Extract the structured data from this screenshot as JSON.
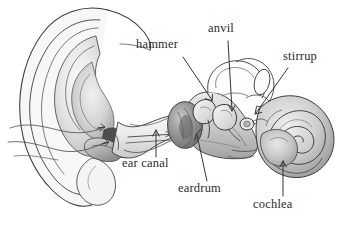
{
  "figure": {
    "style": "grayscale pencil illustration",
    "background_color": "#ffffff",
    "ink_color": "#2b2b2b",
    "width": 346,
    "height": 234
  },
  "labels": [
    {
      "id": "hammer",
      "text": "hammer",
      "x": 136,
      "y": 45,
      "leader": {
        "from_x": 183,
        "from_y": 57,
        "to_x": 212,
        "to_y": 102,
        "arrow": true
      }
    },
    {
      "id": "anvil",
      "text": "anvil",
      "x": 208,
      "y": 29,
      "leader": {
        "from_x": 228,
        "from_y": 41,
        "to_x": 233,
        "to_y": 112,
        "arrow": true
      }
    },
    {
      "id": "stirrup",
      "text": "stirrup",
      "x": 283,
      "y": 57,
      "leader": {
        "from_x": 288,
        "from_y": 68,
        "to_x": 255,
        "to_y": 113,
        "arrow": true
      }
    },
    {
      "id": "ear-canal",
      "text": "ear canal",
      "x": 122,
      "y": 163,
      "leader": {
        "from_x": 156,
        "from_y": 157,
        "to_x": 156,
        "to_y": 129,
        "arrow": true
      }
    },
    {
      "id": "eardrum",
      "text": "eardrum",
      "x": 178,
      "y": 188,
      "leader": {
        "from_x": 207,
        "from_y": 181,
        "to_x": 197,
        "to_y": 133,
        "arrow": true
      }
    },
    {
      "id": "cochlea",
      "text": "cochlea",
      "x": 253,
      "y": 204,
      "leader": {
        "from_x": 283,
        "from_y": 196,
        "to_x": 283,
        "to_y": 160,
        "arrow": true
      }
    }
  ],
  "structures": [
    {
      "id": "pinna",
      "name": "outer ear / pinna"
    },
    {
      "id": "ear-canal",
      "name": "ear canal"
    },
    {
      "id": "eardrum",
      "name": "eardrum"
    },
    {
      "id": "hammer",
      "name": "hammer bone"
    },
    {
      "id": "anvil",
      "name": "anvil bone"
    },
    {
      "id": "stirrup",
      "name": "stirrup bone"
    },
    {
      "id": "semicircular-canals",
      "name": "semicircular canals"
    },
    {
      "id": "cochlea",
      "name": "cochlea"
    },
    {
      "id": "sound-arrows",
      "name": "sound direction arrows"
    }
  ]
}
